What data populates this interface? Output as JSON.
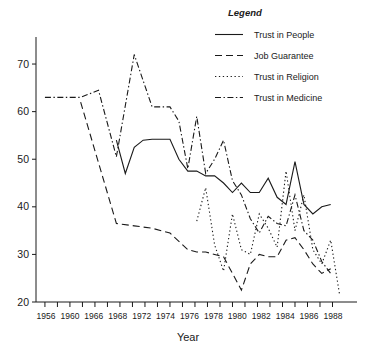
{
  "chart_data": {
    "type": "line",
    "title": "",
    "xlabel": "Year",
    "ylabel": "",
    "xlim": [
      1955,
      1990
    ],
    "ylim": [
      20,
      74
    ],
    "grid": false,
    "legend_position": "top-right",
    "legend_title": "Legend",
    "y_ticks": [
      20,
      30,
      40,
      50,
      60,
      70
    ],
    "x_ticks": [
      1956,
      1958,
      1960,
      1962,
      1964,
      1966,
      1968,
      1970,
      1972,
      1974,
      1976,
      1978,
      1980,
      1982,
      1984,
      1986,
      1988,
      1990
    ],
    "x_tick_labels": [
      "1956",
      "",
      "1960",
      "",
      "1966",
      "",
      "1968",
      "",
      "1972",
      "",
      "1974",
      "",
      "1976",
      "",
      "1978",
      "",
      "1980",
      "",
      "1982",
      "",
      "1984",
      "",
      "1986",
      "",
      "1988"
    ],
    "x_labeled_ticks": [
      {
        "year": 1956,
        "label": "1956"
      },
      {
        "year": 1960,
        "label": "1960"
      },
      {
        "year": 1964,
        "label": "1966"
      },
      {
        "year": 1968,
        "label": "1968"
      },
      {
        "year": 1972,
        "label": "1972"
      },
      {
        "year": 1974,
        "label": "1974"
      },
      {
        "year": 1976,
        "label": "1976"
      },
      {
        "year": 1978,
        "label": "1978"
      },
      {
        "year": 1980,
        "label": "1980"
      },
      {
        "year": 1982,
        "label": "1982"
      },
      {
        "year": 1984,
        "label": "1984"
      },
      {
        "year": 1986,
        "label": "1986"
      },
      {
        "year": 1988,
        "label": "1988"
      }
    ],
    "series": [
      {
        "name": "Trust in People",
        "style": "solid",
        "points": [
          [
            1964,
            54.0
          ],
          [
            1965,
            47.0
          ],
          [
            1966,
            52.5
          ],
          [
            1967,
            54.0
          ],
          [
            1968,
            54.2
          ],
          [
            1969,
            54.2
          ],
          [
            1970,
            54.2
          ],
          [
            1971,
            50.0
          ],
          [
            1972,
            47.5
          ],
          [
            1973,
            47.5
          ],
          [
            1974,
            46.5
          ],
          [
            1975,
            46.5
          ],
          [
            1976,
            45.0
          ],
          [
            1977,
            43.0
          ],
          [
            1978,
            45.0
          ],
          [
            1979,
            43.0
          ],
          [
            1980,
            43.0
          ],
          [
            1981,
            46.0
          ],
          [
            1982,
            42.0
          ],
          [
            1983,
            40.5
          ],
          [
            1984,
            49.5
          ],
          [
            1985,
            40.5
          ],
          [
            1986,
            38.5
          ],
          [
            1987,
            40.0
          ],
          [
            1988,
            40.5
          ]
        ]
      },
      {
        "name": "Job Guarantee",
        "style": "dashed",
        "points": [
          [
            1960,
            62.0
          ],
          [
            1964,
            36.5
          ],
          [
            1966,
            36.0
          ],
          [
            1968,
            35.5
          ],
          [
            1970,
            34.5
          ],
          [
            1972,
            31.0
          ],
          [
            1973,
            30.5
          ],
          [
            1974,
            30.5
          ],
          [
            1975,
            30.0
          ],
          [
            1976,
            29.5
          ],
          [
            1977,
            26.0
          ],
          [
            1978,
            22.5
          ],
          [
            1979,
            28.0
          ],
          [
            1980,
            30.0
          ],
          [
            1981,
            29.5
          ],
          [
            1982,
            29.5
          ],
          [
            1983,
            33.0
          ],
          [
            1984,
            33.5
          ],
          [
            1985,
            31.0
          ],
          [
            1986,
            28.0
          ],
          [
            1987,
            26.0
          ],
          [
            1988,
            27.0
          ]
        ]
      },
      {
        "name": "Trust in Religion",
        "style": "dotted",
        "points": [
          [
            1973,
            37.0
          ],
          [
            1974,
            44.0
          ],
          [
            1975,
            32.0
          ],
          [
            1976,
            26.5
          ],
          [
            1977,
            38.5
          ],
          [
            1978,
            31.0
          ],
          [
            1979,
            30.0
          ],
          [
            1980,
            38.5
          ],
          [
            1981,
            35.5
          ],
          [
            1982,
            31.5
          ],
          [
            1983,
            47.5
          ],
          [
            1984,
            35.0
          ],
          [
            1985,
            42.5
          ],
          [
            1986,
            31.0
          ],
          [
            1987,
            28.0
          ],
          [
            1988,
            33.0
          ],
          [
            1989,
            21.5
          ]
        ]
      },
      {
        "name": "Trust in Medicine",
        "style": "dashdot",
        "points": [
          [
            1956,
            63.0
          ],
          [
            1958,
            63.0
          ],
          [
            1960,
            63.0
          ],
          [
            1962,
            64.5
          ],
          [
            1964,
            50.5
          ],
          [
            1966,
            72.0
          ],
          [
            1968,
            61.0
          ],
          [
            1969,
            61.0
          ],
          [
            1970,
            61.0
          ],
          [
            1971,
            58.0
          ],
          [
            1972,
            48.0
          ],
          [
            1973,
            59.0
          ],
          [
            1974,
            47.0
          ],
          [
            1975,
            50.0
          ],
          [
            1976,
            54.0
          ],
          [
            1977,
            45.5
          ],
          [
            1978,
            42.5
          ],
          [
            1979,
            37.5
          ],
          [
            1980,
            34.5
          ],
          [
            1981,
            38.0
          ],
          [
            1982,
            36.5
          ],
          [
            1983,
            36.0
          ],
          [
            1984,
            42.5
          ],
          [
            1985,
            35.0
          ],
          [
            1986,
            33.0
          ],
          [
            1987,
            28.5
          ],
          [
            1988,
            26.0
          ]
        ]
      }
    ]
  },
  "legend": {
    "title": "Legend",
    "entries": [
      {
        "label": "Trust in People",
        "style": "solid"
      },
      {
        "label": "Job Guarantee",
        "style": "dashed"
      },
      {
        "label": "Trust in Religion",
        "style": "dotted"
      },
      {
        "label": "Trust in Medicine",
        "style": "dashdot"
      }
    ]
  },
  "axes": {
    "x_title": "Year",
    "y_tick_labels": [
      "20",
      "30",
      "40",
      "50",
      "60",
      "70"
    ]
  }
}
